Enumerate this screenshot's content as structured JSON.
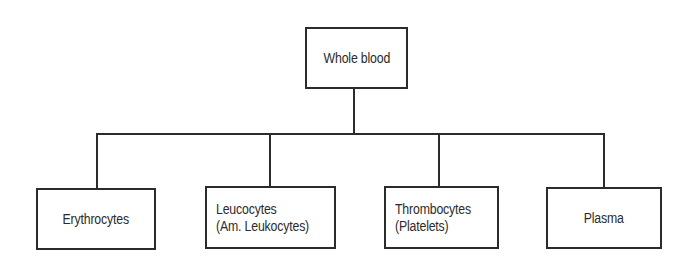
{
  "diagram": {
    "type": "tree",
    "root": {
      "id": "whole-blood",
      "label": "Whole blood"
    },
    "children": [
      {
        "id": "erythrocytes",
        "label": "Erythrocytes"
      },
      {
        "id": "leucocytes",
        "label": "Leucocytes\n(Am. Leukocytes)"
      },
      {
        "id": "thrombocytes",
        "label": "Thrombocytes\n(Platelets)"
      },
      {
        "id": "plasma",
        "label": "Plasma"
      }
    ],
    "edges": [
      {
        "from": "whole-blood",
        "to": "erythrocytes"
      },
      {
        "from": "whole-blood",
        "to": "leucocytes"
      },
      {
        "from": "whole-blood",
        "to": "thrombocytes"
      },
      {
        "from": "whole-blood",
        "to": "plasma"
      }
    ],
    "colors": {
      "stroke": "#2b2b2b",
      "background": "#ffffff",
      "text": "#2b2b2b"
    }
  }
}
